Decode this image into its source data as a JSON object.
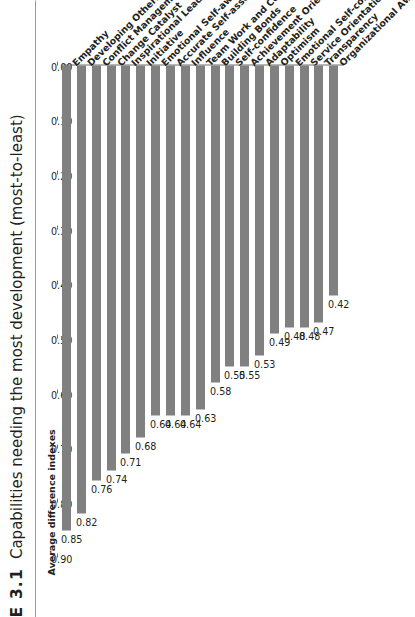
{
  "figure": {
    "number_label": "E 3.1",
    "caption": "Capabilities needing the most development (most-to-least)"
  },
  "chart_data": {
    "type": "bar",
    "orientation": "horizontal",
    "title": "Capabilities needing the most development (most-to-least)",
    "xlabel": "Average difference indexes",
    "ylabel": "",
    "axis_title": "Average difference indexes",
    "xlim": [
      0.0,
      0.9
    ],
    "grid": false,
    "legend": "none",
    "bar_color": "#808080",
    "tick_labels": [
      "0.90",
      "0.80",
      "0.70",
      "0.60",
      "0.50",
      "0.40",
      "0.30",
      "0.20",
      "0.10",
      "0.00"
    ],
    "tick_values": [
      0.9,
      0.8,
      0.7,
      0.6,
      0.5,
      0.4,
      0.3,
      0.2,
      0.1,
      0.0
    ],
    "categories": [
      "Empathy",
      "Developing Others",
      "Conflict Management",
      "Change Catalyst",
      "Inspirational Leadership",
      "Initiative",
      "Emotional Self-awareness",
      "Accurate Self-assessment",
      "Influence",
      "Team Work and Collaboration",
      "Building Bonds",
      "Self-confidence",
      "Achievement Orientation",
      "Adaptability",
      "Optimism",
      "Emotional Self-control",
      "Service Orientation",
      "Transparency",
      "Organizational Awareness"
    ],
    "values": [
      0.85,
      0.82,
      0.76,
      0.74,
      0.71,
      0.68,
      0.64,
      0.64,
      0.64,
      0.63,
      0.58,
      0.55,
      0.55,
      0.53,
      0.49,
      0.48,
      0.48,
      0.47,
      0.42
    ],
    "value_labels": [
      "0.85",
      "0.82",
      "0.76",
      "0.74",
      "0.71",
      "0.68",
      "0.64",
      "0.64",
      "0.64",
      "0.63",
      "0.58",
      "0.55",
      "0.55",
      "0.53",
      "0.49",
      "0.48",
      "0.48",
      "0.47",
      "0.42"
    ]
  }
}
